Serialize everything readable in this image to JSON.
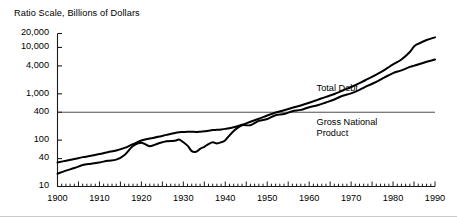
{
  "title": "Ratio Scale, Billions of Dollars",
  "colors": {
    "ink": "#000000",
    "axis": "#1a1a1a",
    "gridline": "#3a3a3a",
    "rule": "#c9c9c9"
  },
  "axes": {
    "y_ticks": [
      "10",
      "40",
      "100",
      "400",
      "1,000",
      "4,000",
      "10,000",
      "20,000"
    ],
    "x_ticks": [
      "1900",
      "1910",
      "1920",
      "1930",
      "1940",
      "1950",
      "1960",
      "1970",
      "1980",
      "1990"
    ]
  },
  "series_labels": {
    "total_debt": "Total Debt",
    "gnp_line1": "Gross National",
    "gnp_line2": "Product"
  },
  "chart_data": {
    "type": "line",
    "title": "Ratio Scale, Billions of Dollars",
    "xlabel": "",
    "ylabel": "Ratio Scale, Billions of Dollars",
    "yscale": "log",
    "ylim": [
      10,
      20000
    ],
    "xlim": [
      1900,
      1990
    ],
    "ytick_values": [
      10,
      40,
      100,
      400,
      1000,
      4000,
      10000,
      20000
    ],
    "ytick_labels": [
      "10",
      "40",
      "100",
      "400",
      "1,000",
      "4,000",
      "10,000",
      "20,000"
    ],
    "xtick_values": [
      1900,
      1910,
      1920,
      1930,
      1940,
      1950,
      1960,
      1970,
      1980,
      1990
    ],
    "xtick_labels": [
      "1900",
      "1910",
      "1920",
      "1930",
      "1940",
      "1950",
      "1960",
      "1970",
      "1980",
      "1990"
    ],
    "x_minor_tick_interval": 1,
    "x_major_tick_interval": 5,
    "grid": false,
    "legend": "inline-annotations",
    "annotations": [
      {
        "text": "Total Debt",
        "x": 1962,
        "y": 1250
      },
      {
        "text": "Gross National Product",
        "x": 1962,
        "y": 230
      }
    ],
    "reference_lines": [
      {
        "orientation": "horizontal",
        "y": 400,
        "x_start": 1900,
        "x_end": 1990,
        "style": "thin-solid"
      }
    ],
    "x": [
      1900,
      1902,
      1904,
      1906,
      1908,
      1910,
      1912,
      1914,
      1916,
      1918,
      1920,
      1922,
      1924,
      1926,
      1928,
      1929,
      1930,
      1931,
      1932,
      1933,
      1934,
      1935,
      1936,
      1937,
      1938,
      1939,
      1940,
      1942,
      1944,
      1946,
      1948,
      1950,
      1952,
      1954,
      1956,
      1958,
      1960,
      1962,
      1964,
      1966,
      1968,
      1970,
      1972,
      1974,
      1976,
      1978,
      1980,
      1982,
      1984,
      1985,
      1986,
      1988,
      1990
    ],
    "series": [
      {
        "name": "Total Debt",
        "values": [
          33,
          36,
          39,
          43,
          46,
          50,
          55,
          60,
          68,
          82,
          98,
          108,
          118,
          130,
          143,
          148,
          150,
          152,
          152,
          150,
          152,
          155,
          160,
          165,
          167,
          170,
          175,
          190,
          215,
          250,
          290,
          340,
          395,
          440,
          500,
          560,
          640,
          740,
          860,
          990,
          1180,
          1400,
          1700,
          2100,
          2600,
          3300,
          4300,
          5500,
          8000,
          10500,
          12000,
          14500,
          16500
        ]
      },
      {
        "name": "Gross National Product",
        "values": [
          19,
          22,
          25,
          29,
          31,
          33,
          36,
          38,
          48,
          75,
          88,
          74,
          85,
          95,
          97,
          103,
          90,
          76,
          58,
          56,
          65,
          72,
          82,
          90,
          85,
          90,
          100,
          158,
          210,
          210,
          260,
          285,
          345,
          365,
          420,
          450,
          515,
          565,
          650,
          755,
          910,
          1020,
          1210,
          1500,
          1800,
          2270,
          2790,
          3200,
          3800,
          4050,
          4300,
          4900,
          5500
        ]
      }
    ]
  }
}
